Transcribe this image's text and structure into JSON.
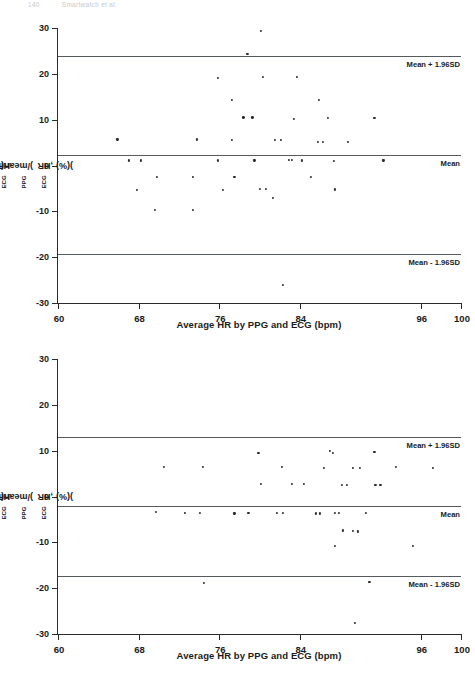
{
  "header": {
    "page_number": "140",
    "running_head": "Smartwatch et al."
  },
  "chart_data": [
    {
      "id": "bland-altman-1",
      "type": "scatter",
      "title": "",
      "xlabel": "Average HR by PPG and ECG (bpm)",
      "ylabel": "(HR_PPG-HR_ECG)/mean(HR_PPG,HR_ECG)(%)",
      "ylabel_parts": {
        "p1": "(HR",
        "s1": "PPG",
        "p2": "-HR",
        "s2": "ECG",
        "p3": ")/mean(HR",
        "s3": "PPG",
        "p4": ",HR",
        "s4": "ECG",
        "p5": ")(%)"
      },
      "xlim": [
        60,
        100
      ],
      "ylim": [
        -30,
        30
      ],
      "xticks": [
        60,
        68,
        76,
        84,
        96,
        100
      ],
      "xticklabels": [
        "60",
        "68",
        "76",
        "84",
        "96",
        "100"
      ],
      "yticks": [
        30,
        20,
        10,
        0,
        -10,
        -20,
        -30
      ],
      "yticklabels": [
        "30",
        "20",
        "10",
        "0",
        "-10",
        "-20",
        "-30"
      ],
      "grid": false,
      "reference_lines": [
        {
          "name": "upper-limit",
          "label": "Mean + 1.96SD",
          "value": 24.0
        },
        {
          "name": "mean",
          "label": "Mean",
          "value": 2.3
        },
        {
          "name": "lower-limit",
          "label": "Mean - 1.96SD",
          "value": -19.2
        }
      ],
      "points": [
        {
          "x": 80.1,
          "y": 29.4
        },
        {
          "x": 78.8,
          "y": 24.4
        },
        {
          "x": 75.9,
          "y": 19.2
        },
        {
          "x": 80.3,
          "y": 19.3
        },
        {
          "x": 83.7,
          "y": 19.3
        },
        {
          "x": 77.3,
          "y": 14.4
        },
        {
          "x": 85.9,
          "y": 14.4
        },
        {
          "x": 78.4,
          "y": 10.5
        },
        {
          "x": 79.3,
          "y": 10.5
        },
        {
          "x": 83.4,
          "y": 10.2
        },
        {
          "x": 86.8,
          "y": 10.3
        },
        {
          "x": 91.4,
          "y": 10.3
        },
        {
          "x": 65.9,
          "y": 5.7
        },
        {
          "x": 73.8,
          "y": 5.7
        },
        {
          "x": 77.3,
          "y": 5.5
        },
        {
          "x": 81.5,
          "y": 5.6
        },
        {
          "x": 82.1,
          "y": 5.6
        },
        {
          "x": 85.8,
          "y": 5.2
        },
        {
          "x": 86.3,
          "y": 5.2
        },
        {
          "x": 88.8,
          "y": 5.1
        },
        {
          "x": 67.0,
          "y": 1.1
        },
        {
          "x": 68.2,
          "y": 1.1
        },
        {
          "x": 75.9,
          "y": 1.1
        },
        {
          "x": 79.5,
          "y": 1.1
        },
        {
          "x": 82.9,
          "y": 1.2
        },
        {
          "x": 83.2,
          "y": 1.2
        },
        {
          "x": 84.2,
          "y": 1.1
        },
        {
          "x": 87.4,
          "y": 1.0
        },
        {
          "x": 92.3,
          "y": 1.1
        },
        {
          "x": 69.8,
          "y": -2.5
        },
        {
          "x": 73.4,
          "y": -2.5
        },
        {
          "x": 77.5,
          "y": -2.4
        },
        {
          "x": 85.1,
          "y": -2.4
        },
        {
          "x": 67.8,
          "y": -5.4
        },
        {
          "x": 76.4,
          "y": -5.3
        },
        {
          "x": 80.0,
          "y": -5.1
        },
        {
          "x": 80.6,
          "y": -5.1
        },
        {
          "x": 87.5,
          "y": -5.2
        },
        {
          "x": 81.3,
          "y": -7.1
        },
        {
          "x": 69.6,
          "y": -9.6
        },
        {
          "x": 73.4,
          "y": -9.6
        },
        {
          "x": 82.3,
          "y": -26.0
        }
      ]
    },
    {
      "id": "bland-altman-2",
      "type": "scatter",
      "title": "",
      "xlabel": "Average HR by PPG and ECG (bpm)",
      "ylabel": "(HR_PPG-HR_ECG)/mean(HR_PPG,HR_ECG)(%)",
      "ylabel_parts": {
        "p1": "(HR",
        "s1": "PPG",
        "p2": "-HR",
        "s2": "ECG",
        "p3": ")/mean(HR",
        "s3": "PPG",
        "p4": ",HR",
        "s4": "ECG",
        "p5": ")(%)"
      },
      "xlim": [
        60,
        100
      ],
      "ylim": [
        -30,
        30
      ],
      "xticks": [
        60,
        68,
        76,
        84,
        96,
        100
      ],
      "xticklabels": [
        "60",
        "68",
        "76",
        "84",
        "96",
        "100"
      ],
      "yticks": [
        30,
        20,
        10,
        0,
        -10,
        -20,
        -30
      ],
      "yticklabels": [
        "30",
        "20",
        "10",
        "0",
        "-10",
        "-20",
        "-30"
      ],
      "grid": false,
      "reference_lines": [
        {
          "name": "upper-limit",
          "label": "Mean + 1.96SD",
          "value": 13.0
        },
        {
          "name": "mean",
          "label": "Mean",
          "value": -2.0
        },
        {
          "name": "lower-limit",
          "label": "Mean - 1.96SD",
          "value": -17.4
        }
      ],
      "points": [
        {
          "x": 79.9,
          "y": 9.6
        },
        {
          "x": 87.0,
          "y": 9.9
        },
        {
          "x": 87.3,
          "y": 9.6
        },
        {
          "x": 91.4,
          "y": 9.8
        },
        {
          "x": 70.5,
          "y": 6.5
        },
        {
          "x": 74.4,
          "y": 6.5
        },
        {
          "x": 82.2,
          "y": 6.4
        },
        {
          "x": 86.4,
          "y": 6.3
        },
        {
          "x": 89.3,
          "y": 6.3
        },
        {
          "x": 90.0,
          "y": 6.3
        },
        {
          "x": 93.5,
          "y": 6.4
        },
        {
          "x": 97.2,
          "y": 6.3
        },
        {
          "x": 80.1,
          "y": 2.7
        },
        {
          "x": 83.2,
          "y": 2.8
        },
        {
          "x": 84.4,
          "y": 2.8
        },
        {
          "x": 88.2,
          "y": 2.6
        },
        {
          "x": 88.7,
          "y": 2.5
        },
        {
          "x": 91.5,
          "y": 2.6
        },
        {
          "x": 92.0,
          "y": 2.6
        },
        {
          "x": 69.7,
          "y": -3.4
        },
        {
          "x": 72.6,
          "y": -3.6
        },
        {
          "x": 74.1,
          "y": -3.5
        },
        {
          "x": 77.5,
          "y": -3.7
        },
        {
          "x": 78.9,
          "y": -3.5
        },
        {
          "x": 81.7,
          "y": -3.5
        },
        {
          "x": 82.3,
          "y": -3.5
        },
        {
          "x": 85.6,
          "y": -3.7
        },
        {
          "x": 86.0,
          "y": -3.7
        },
        {
          "x": 87.5,
          "y": -3.6
        },
        {
          "x": 87.9,
          "y": -3.6
        },
        {
          "x": 90.6,
          "y": -3.6
        },
        {
          "x": 88.3,
          "y": -7.4
        },
        {
          "x": 89.3,
          "y": -7.5
        },
        {
          "x": 89.8,
          "y": -7.6
        },
        {
          "x": 87.5,
          "y": -10.8
        },
        {
          "x": 95.2,
          "y": -10.7
        },
        {
          "x": 74.5,
          "y": -18.8
        },
        {
          "x": 90.9,
          "y": -18.7
        },
        {
          "x": 89.5,
          "y": -27.5
        }
      ]
    }
  ]
}
